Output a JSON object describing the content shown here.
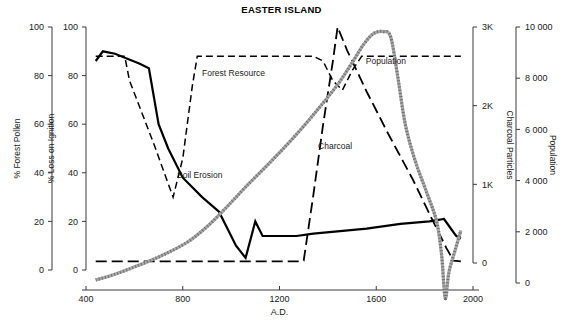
{
  "chart_data": {
    "type": "line",
    "title": "EASTER ISLAND",
    "xlabel": "A.D.",
    "xlim": [
      400,
      2000
    ],
    "xticks": [
      400,
      800,
      1200,
      1600,
      2000
    ],
    "xtick_labels": [
      "400",
      "800",
      "1200",
      "1600",
      "2000"
    ],
    "grid": false,
    "legend": "inline-labels",
    "axes": [
      {
        "id": "forest-pollen",
        "label": "% Forest Pollen",
        "side": "left",
        "position": 1,
        "ticks": [
          100,
          80,
          60,
          40,
          20,
          0
        ],
        "tick_labels": [
          "100",
          "80",
          "60",
          "40",
          "20",
          "0"
        ],
        "range": [
          100,
          0
        ],
        "inverted": true
      },
      {
        "id": "loss-on-ignition",
        "label": "% Loss on Ignition",
        "side": "left",
        "position": 2,
        "ticks": [
          0,
          20,
          40,
          60,
          80,
          100
        ],
        "tick_labels": [
          "0",
          "20",
          "40",
          "60",
          "80",
          "100"
        ],
        "range": [
          0,
          100
        ],
        "inverted": false
      },
      {
        "id": "charcoal-particles",
        "label": "Charcoal Particles",
        "side": "right",
        "position": 1,
        "ticks": [
          3000,
          2000,
          1000,
          0
        ],
        "tick_labels": [
          "3K",
          "2K",
          "1K",
          "0"
        ],
        "range": [
          0,
          3000
        ],
        "inverted": false
      },
      {
        "id": "population",
        "label": "Population",
        "side": "right",
        "position": 2,
        "ticks": [
          10000,
          8000,
          6000,
          4000,
          2000,
          0
        ],
        "tick_labels": [
          "10 000",
          "8 000",
          "6 000",
          "4 000",
          "2 000",
          "0"
        ],
        "range": [
          0,
          10000
        ],
        "inverted": false
      }
    ],
    "series": [
      {
        "name": "Forest Resource",
        "axis": "forest-pollen",
        "style": "solid",
        "color": "#000000",
        "width": 2.2,
        "label_x": 1010,
        "label_y_pct": 80,
        "points": [
          [
            440,
            86
          ],
          [
            470,
            90
          ],
          [
            520,
            89
          ],
          [
            620,
            85
          ],
          [
            660,
            83
          ],
          [
            700,
            60
          ],
          [
            740,
            50
          ],
          [
            800,
            38
          ],
          [
            880,
            30
          ],
          [
            950,
            24
          ],
          [
            1020,
            10
          ],
          [
            1060,
            5
          ],
          [
            1100,
            20
          ],
          [
            1130,
            14
          ],
          [
            1200,
            14
          ],
          [
            1270,
            14
          ],
          [
            1340,
            15
          ],
          [
            1450,
            16
          ],
          [
            1560,
            17
          ],
          [
            1700,
            19
          ],
          [
            1820,
            20
          ],
          [
            1880,
            21
          ],
          [
            1930,
            14
          ],
          [
            1950,
            13
          ]
        ]
      },
      {
        "name": "Soil Erosion",
        "axis": "loss-on-ignition",
        "style": "dashed",
        "color": "#000000",
        "width": 1.5,
        "label_x": 870,
        "label_y_pct": 38,
        "points": [
          [
            440,
            88
          ],
          [
            520,
            88
          ],
          [
            560,
            88
          ],
          [
            580,
            78
          ],
          [
            680,
            52
          ],
          [
            760,
            30
          ],
          [
            800,
            46
          ],
          [
            840,
            76
          ],
          [
            860,
            88
          ],
          [
            1050,
            88
          ],
          [
            1200,
            88
          ],
          [
            1340,
            88
          ],
          [
            1380,
            86
          ],
          [
            1420,
            78
          ],
          [
            1460,
            74
          ],
          [
            1500,
            82
          ],
          [
            1540,
            88
          ],
          [
            1700,
            88
          ],
          [
            1850,
            88
          ],
          [
            1950,
            88
          ]
        ]
      },
      {
        "name": "Charcoal",
        "axis": "charcoal-particles",
        "style": "long-dash",
        "color": "#000000",
        "width": 1.8,
        "label_x": 1430,
        "label_y_val": 1450,
        "points": [
          [
            440,
            20
          ],
          [
            700,
            20
          ],
          [
            900,
            20
          ],
          [
            1100,
            20
          ],
          [
            1280,
            20
          ],
          [
            1300,
            30
          ],
          [
            1340,
            870
          ],
          [
            1380,
            1750
          ],
          [
            1420,
            2550
          ],
          [
            1440,
            3000
          ],
          [
            1480,
            2700
          ],
          [
            1560,
            2180
          ],
          [
            1650,
            1640
          ],
          [
            1750,
            1070
          ],
          [
            1830,
            560
          ],
          [
            1890,
            190
          ],
          [
            1920,
            30
          ],
          [
            1950,
            20
          ]
        ]
      },
      {
        "name": "Population",
        "axis": "population",
        "style": "stippled",
        "color": "#a8a8a8",
        "width": 3.2,
        "label_x": 1640,
        "label_y_val": 8550,
        "points": [
          [
            440,
            120
          ],
          [
            520,
            340
          ],
          [
            620,
            700
          ],
          [
            720,
            1100
          ],
          [
            820,
            1600
          ],
          [
            900,
            2200
          ],
          [
            980,
            2950
          ],
          [
            1060,
            3750
          ],
          [
            1160,
            4700
          ],
          [
            1260,
            5700
          ],
          [
            1360,
            6800
          ],
          [
            1440,
            7750
          ],
          [
            1500,
            8600
          ],
          [
            1550,
            9350
          ],
          [
            1590,
            9750
          ],
          [
            1630,
            9820
          ],
          [
            1660,
            9600
          ],
          [
            1690,
            8000
          ],
          [
            1720,
            6200
          ],
          [
            1760,
            4800
          ],
          [
            1810,
            3500
          ],
          [
            1850,
            2400
          ],
          [
            1870,
            1100
          ],
          [
            1885,
            -600
          ],
          [
            1900,
            400
          ],
          [
            1925,
            1250
          ],
          [
            1950,
            2050
          ]
        ]
      }
    ]
  }
}
